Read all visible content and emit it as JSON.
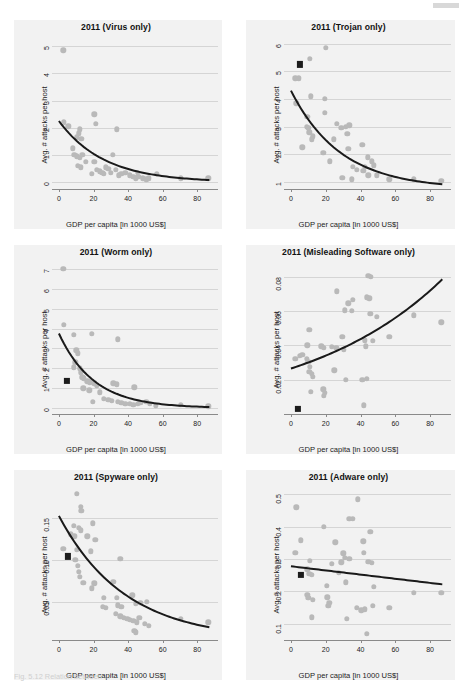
{
  "figure": {
    "caption_fragment": "Fig. 5.12  Relation between ...",
    "corner_mark": "page-edge-mark"
  },
  "common": {
    "xlabel": "GDP per capita [in 1000 US$]",
    "ylabel": "Avg. # attacks per host",
    "xticks": [
      0,
      20,
      40,
      60,
      80
    ],
    "xlim": [
      -4,
      92
    ],
    "point_color": "#b9b9b9",
    "marker_color": "#1c1c1c",
    "curve_color": "#1a1a1a",
    "panel_bg": "#f2f2f2",
    "gridline_color": "#d5d5d5"
  },
  "chart_data": [
    {
      "type": "scatter",
      "title": "2011 (Virus only)",
      "xlabel": "GDP per capita [in 1000 US$]",
      "ylabel": "Avg. # attacks per host",
      "xlim": [
        -4,
        92
      ],
      "ylim": [
        -0.25,
        5.3
      ],
      "yticks": [
        0,
        1,
        2,
        3,
        4,
        5
      ],
      "grid": true,
      "legend": "none",
      "points": [
        [
          2.5,
          4.85
        ],
        [
          20.5,
          2.5
        ],
        [
          21.5,
          2.15
        ],
        [
          12.0,
          1.95
        ],
        [
          11.5,
          1.8
        ],
        [
          33.5,
          1.95
        ],
        [
          10.5,
          1.65
        ],
        [
          13.0,
          1.6
        ],
        [
          3.0,
          2.2
        ],
        [
          5.5,
          2.05
        ],
        [
          9.0,
          1.0
        ],
        [
          10.5,
          0.95
        ],
        [
          12.0,
          0.9
        ],
        [
          13.5,
          1.0
        ],
        [
          15.5,
          0.75
        ],
        [
          11.0,
          0.6
        ],
        [
          12.5,
          0.55
        ],
        [
          20.5,
          0.75
        ],
        [
          22.0,
          0.45
        ],
        [
          23.5,
          0.4
        ],
        [
          25.0,
          0.35
        ],
        [
          27.0,
          0.55
        ],
        [
          28.5,
          0.5
        ],
        [
          31.0,
          1.0
        ],
        [
          30.0,
          0.35
        ],
        [
          33.0,
          0.45
        ],
        [
          34.5,
          0.25
        ],
        [
          36.0,
          0.3
        ],
        [
          38.5,
          0.35
        ],
        [
          41.0,
          0.25
        ],
        [
          43.0,
          0.2
        ],
        [
          44.5,
          0.15
        ],
        [
          46.0,
          0.2
        ],
        [
          48.5,
          0.15
        ],
        [
          50.5,
          0.1
        ],
        [
          52.0,
          0.15
        ],
        [
          56.5,
          0.3
        ],
        [
          70.5,
          0.15
        ],
        [
          86.5,
          0.15
        ],
        [
          8.0,
          1.25
        ],
        [
          19.0,
          0.3
        ],
        [
          26.0,
          0.3
        ],
        [
          45.5,
          0.35
        ]
      ],
      "highlight_marker": null,
      "fit": {
        "kind": "exponential-decay",
        "y0": 2.25,
        "y_end": 0.08
      }
    },
    {
      "type": "scatter",
      "title": "2011 (Trojan only)",
      "xlabel": "GDP per capita [in 1000 US$]",
      "ylabel": "Avg. # attacks per host",
      "xlim": [
        -4,
        92
      ],
      "ylim": [
        0.75,
        6.2
      ],
      "yticks": [
        1,
        2,
        3,
        4,
        5,
        6
      ],
      "grid": true,
      "legend": "none",
      "points": [
        [
          20.0,
          5.85
        ],
        [
          11.0,
          5.45
        ],
        [
          2.5,
          4.75
        ],
        [
          4.5,
          4.75
        ],
        [
          3.0,
          3.85
        ],
        [
          11.5,
          4.1
        ],
        [
          19.5,
          4.0
        ],
        [
          9.5,
          3.35
        ],
        [
          19.5,
          3.5
        ],
        [
          26.5,
          3.1
        ],
        [
          9.0,
          3.0
        ],
        [
          10.0,
          2.95
        ],
        [
          10.5,
          2.8
        ],
        [
          12.5,
          2.65
        ],
        [
          12.0,
          2.55
        ],
        [
          24.5,
          2.55
        ],
        [
          29.0,
          2.95
        ],
        [
          31.5,
          3.0
        ],
        [
          33.5,
          3.05
        ],
        [
          32.5,
          2.75
        ],
        [
          6.5,
          2.25
        ],
        [
          18.5,
          2.05
        ],
        [
          22.5,
          1.75
        ],
        [
          33.0,
          2.2
        ],
        [
          41.0,
          2.35
        ],
        [
          35.5,
          1.55
        ],
        [
          38.0,
          1.45
        ],
        [
          41.5,
          1.4
        ],
        [
          42.5,
          1.55
        ],
        [
          44.0,
          1.9
        ],
        [
          46.5,
          1.75
        ],
        [
          47.5,
          1.6
        ],
        [
          44.5,
          1.25
        ],
        [
          49.5,
          1.25
        ],
        [
          56.5,
          1.1
        ],
        [
          70.5,
          1.1
        ],
        [
          86.5,
          1.05
        ],
        [
          29.5,
          1.15
        ],
        [
          35.0,
          1.1
        ]
      ],
      "highlight_marker": [
        5.0,
        5.25
      ],
      "fit": {
        "kind": "exponential-decay",
        "y0": 4.3,
        "y_end": 0.92
      }
    },
    {
      "type": "scatter",
      "title": "2011 (Worm only)",
      "xlabel": "GDP per capita [in 1000 US$]",
      "ylabel": "Avg. # attacks per host",
      "xlim": [
        -4,
        92
      ],
      "ylim": [
        -0.3,
        7.3
      ],
      "yticks": [
        0,
        1,
        2,
        3,
        4,
        5,
        6,
        7
      ],
      "grid": true,
      "legend": "none",
      "points": [
        [
          2.5,
          7.0
        ],
        [
          3.0,
          4.2
        ],
        [
          8.5,
          3.7
        ],
        [
          19.0,
          3.75
        ],
        [
          34.0,
          3.45
        ],
        [
          10.0,
          2.9
        ],
        [
          11.0,
          2.75
        ],
        [
          9.5,
          2.3
        ],
        [
          8.5,
          2.05
        ],
        [
          12.0,
          2.0
        ],
        [
          12.5,
          1.8
        ],
        [
          13.5,
          1.55
        ],
        [
          14.5,
          1.5
        ],
        [
          16.5,
          1.35
        ],
        [
          18.0,
          1.3
        ],
        [
          20.5,
          1.25
        ],
        [
          22.0,
          1.15
        ],
        [
          31.5,
          1.25
        ],
        [
          33.5,
          1.2
        ],
        [
          43.5,
          1.05
        ],
        [
          23.5,
          0.8
        ],
        [
          19.5,
          0.3
        ],
        [
          26.0,
          0.45
        ],
        [
          28.5,
          0.4
        ],
        [
          30.5,
          0.35
        ],
        [
          34.0,
          0.3
        ],
        [
          36.0,
          0.25
        ],
        [
          38.5,
          0.2
        ],
        [
          41.0,
          0.2
        ],
        [
          43.0,
          0.15
        ],
        [
          45.5,
          0.2
        ],
        [
          47.0,
          0.25
        ],
        [
          50.5,
          0.3
        ],
        [
          52.5,
          0.2
        ],
        [
          56.0,
          0.1
        ],
        [
          70.5,
          0.15
        ],
        [
          86.5,
          0.08
        ],
        [
          14.0,
          1.0
        ],
        [
          17.5,
          0.9
        ]
      ],
      "highlight_marker": [
        4.5,
        1.35
      ],
      "fit": {
        "kind": "exponential-decay",
        "y0": 3.75,
        "y_end": 0.05
      }
    },
    {
      "type": "scatter",
      "title": "2011 (Misleading Software only)",
      "xlabel": "GDP per capita [in 1000 US$]",
      "ylabel": "Avg. # attacks per host",
      "xlim": [
        -4,
        92
      ],
      "ylim": [
        0.0,
        0.088
      ],
      "yticks": [
        0.02,
        0.04,
        0.06,
        0.08
      ],
      "ytick_labels": [
        "0.02",
        "0.04",
        "0.06",
        "0.08"
      ],
      "grid": true,
      "legend": "none",
      "points": [
        [
          44.5,
          0.0805
        ],
        [
          46.0,
          0.08
        ],
        [
          26.5,
          0.0715
        ],
        [
          33.0,
          0.0645
        ],
        [
          35.5,
          0.0665
        ],
        [
          43.5,
          0.068
        ],
        [
          45.0,
          0.0675
        ],
        [
          31.0,
          0.0605
        ],
        [
          35.0,
          0.06
        ],
        [
          45.5,
          0.0585
        ],
        [
          49.5,
          0.0565
        ],
        [
          70.5,
          0.0575
        ],
        [
          86.5,
          0.0535
        ],
        [
          10.5,
          0.049
        ],
        [
          29.5,
          0.045
        ],
        [
          42.5,
          0.043
        ],
        [
          47.0,
          0.0425
        ],
        [
          56.5,
          0.045
        ],
        [
          9.5,
          0.04
        ],
        [
          17.5,
          0.0395
        ],
        [
          19.0,
          0.0385
        ],
        [
          23.5,
          0.039
        ],
        [
          26.0,
          0.0385
        ],
        [
          30.5,
          0.0375
        ],
        [
          43.0,
          0.0395
        ],
        [
          5.0,
          0.034
        ],
        [
          6.5,
          0.0345
        ],
        [
          2.5,
          0.032
        ],
        [
          9.0,
          0.032
        ],
        [
          10.0,
          0.0305
        ],
        [
          11.0,
          0.0275
        ],
        [
          10.5,
          0.0245
        ],
        [
          12.0,
          0.0235
        ],
        [
          12.5,
          0.0215
        ],
        [
          25.0,
          0.0255
        ],
        [
          31.5,
          0.02
        ],
        [
          41.0,
          0.02
        ],
        [
          43.5,
          0.0205
        ],
        [
          11.5,
          0.013
        ],
        [
          18.5,
          0.0145
        ],
        [
          19.5,
          0.0125
        ],
        [
          19.0,
          0.0105
        ],
        [
          42.0,
          0.005
        ]
      ],
      "highlight_marker": [
        4.0,
        0.003
      ],
      "fit": {
        "kind": "exponential-growth",
        "y0": 0.0265,
        "y_end": 0.0785
      }
    },
    {
      "type": "scatter",
      "title": "2011 (Spyware only)",
      "xlabel": "GDP per capita [in 1000 US$]",
      "ylabel": "Avg. # attacks per host",
      "xlim": [
        -4,
        92
      ],
      "ylim": [
        0.005,
        0.185
      ],
      "yticks": [
        0.05,
        0.1,
        0.15
      ],
      "ytick_labels": [
        "0.05",
        "0.10",
        "0.15"
      ],
      "grid": true,
      "legend": "none",
      "points": [
        [
          10.5,
          0.178
        ],
        [
          12.5,
          0.163
        ],
        [
          13.0,
          0.158
        ],
        [
          8.5,
          0.14
        ],
        [
          11.5,
          0.138
        ],
        [
          12.5,
          0.135
        ],
        [
          19.5,
          0.143
        ],
        [
          7.0,
          0.13
        ],
        [
          9.0,
          0.128
        ],
        [
          16.5,
          0.128
        ],
        [
          21.0,
          0.124
        ],
        [
          2.5,
          0.113
        ],
        [
          10.5,
          0.112
        ],
        [
          18.5,
          0.11
        ],
        [
          9.5,
          0.1
        ],
        [
          35.5,
          0.101
        ],
        [
          11.0,
          0.093
        ],
        [
          11.5,
          0.086
        ],
        [
          12.0,
          0.08
        ],
        [
          14.0,
          0.073
        ],
        [
          20.5,
          0.072
        ],
        [
          19.0,
          0.066
        ],
        [
          31.5,
          0.074
        ],
        [
          26.0,
          0.055
        ],
        [
          33.5,
          0.055
        ],
        [
          42.5,
          0.058
        ],
        [
          25.5,
          0.044
        ],
        [
          27.0,
          0.043
        ],
        [
          34.0,
          0.046
        ],
        [
          36.0,
          0.044
        ],
        [
          44.5,
          0.048
        ],
        [
          47.0,
          0.049
        ],
        [
          51.0,
          0.05
        ],
        [
          33.0,
          0.036
        ],
        [
          35.5,
          0.033
        ],
        [
          37.5,
          0.031
        ],
        [
          39.5,
          0.03
        ],
        [
          41.0,
          0.029
        ],
        [
          43.0,
          0.028
        ],
        [
          45.0,
          0.026
        ],
        [
          46.5,
          0.031
        ],
        [
          49.5,
          0.024
        ],
        [
          52.0,
          0.022
        ],
        [
          43.5,
          0.016
        ],
        [
          44.5,
          0.014
        ],
        [
          70.5,
          0.03
        ],
        [
          86.5,
          0.026
        ]
      ],
      "highlight_marker": [
        5.0,
        0.104
      ],
      "fit": {
        "kind": "exponential-decay",
        "y0": 0.152,
        "y_end": 0.02
      }
    },
    {
      "type": "scatter",
      "title": "2011 (Adware only)",
      "xlabel": "GDP per capita [in 1000 US$]",
      "ylabel": "Avg. # attacks per host",
      "xlim": [
        -4,
        92
      ],
      "ylim": [
        0.05,
        0.52
      ],
      "yticks": [
        0.1,
        0.2,
        0.3,
        0.4,
        0.5
      ],
      "ytick_labels": [
        "0.1",
        "0.2",
        "0.3",
        "0.4",
        "0.5"
      ],
      "grid": true,
      "legend": "none",
      "points": [
        [
          38.5,
          0.485
        ],
        [
          3.0,
          0.46
        ],
        [
          33.5,
          0.425
        ],
        [
          35.5,
          0.425
        ],
        [
          19.0,
          0.4
        ],
        [
          45.5,
          0.385
        ],
        [
          5.5,
          0.358
        ],
        [
          25.5,
          0.352
        ],
        [
          41.5,
          0.355
        ],
        [
          2.5,
          0.32
        ],
        [
          42.0,
          0.32
        ],
        [
          30.0,
          0.318
        ],
        [
          31.0,
          0.305
        ],
        [
          33.5,
          0.302
        ],
        [
          11.0,
          0.295
        ],
        [
          23.5,
          0.285
        ],
        [
          29.0,
          0.29
        ],
        [
          44.5,
          0.292
        ],
        [
          46.5,
          0.288
        ],
        [
          9.5,
          0.268
        ],
        [
          10.5,
          0.255
        ],
        [
          12.0,
          0.252
        ],
        [
          27.5,
          0.258
        ],
        [
          20.5,
          0.218
        ],
        [
          31.5,
          0.228
        ],
        [
          47.5,
          0.215
        ],
        [
          70.5,
          0.195
        ],
        [
          86.5,
          0.196
        ],
        [
          9.5,
          0.19
        ],
        [
          10.0,
          0.18
        ],
        [
          12.5,
          0.175
        ],
        [
          21.0,
          0.182
        ],
        [
          22.0,
          0.165
        ],
        [
          21.5,
          0.155
        ],
        [
          38.0,
          0.15
        ],
        [
          40.5,
          0.142
        ],
        [
          42.5,
          0.145
        ],
        [
          47.0,
          0.155
        ],
        [
          56.5,
          0.15
        ],
        [
          12.0,
          0.12
        ],
        [
          32.0,
          0.115
        ],
        [
          43.5,
          0.07
        ]
      ],
      "highlight_marker": [
        5.5,
        0.252
      ],
      "fit": {
        "kind": "linear",
        "y0": 0.278,
        "y_end": 0.222
      }
    }
  ]
}
